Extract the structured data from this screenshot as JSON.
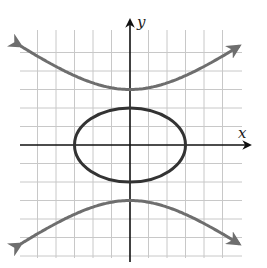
{
  "figure": {
    "type": "graph",
    "axes": {
      "x_label": "x",
      "y_label": "y"
    },
    "grid": {
      "x_range": [
        -5,
        5
      ],
      "y_range": [
        -6,
        5
      ],
      "unit_px": 18.5,
      "visible": true
    },
    "curves": [
      {
        "name": "ellipse",
        "equation": "x^2/9 + y^2/4 = 1",
        "color": "#333333"
      },
      {
        "name": "hyperbola-upper",
        "equation": "y^2/9 - x^2/16 = 1 (y>0)",
        "color": "#6e6e6e"
      },
      {
        "name": "hyperbola-lower",
        "equation": "y^2/9 - x^2/16 = 1 (y<0)",
        "color": "#6e6e6e"
      }
    ]
  }
}
